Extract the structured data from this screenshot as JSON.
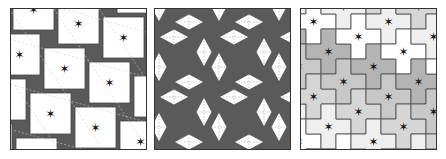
{
  "figure": {
    "panels": [
      {
        "id": "a",
        "description": "Pinwheel tiling of white squares with dark gray square gaps, each white square marked with a star, dashed lattice lines overlaid"
      },
      {
        "id": "b",
        "description": "Tiling of white rhombi (diamonds) on dark gray background with dotted diagonal lattice lines"
      },
      {
        "id": "c",
        "description": "Cross-shaped polyomino tiling in shades of gray, each tile marked with a star"
      }
    ],
    "colors": {
      "dark": "#5a5a5a",
      "white": "#ffffff",
      "light_gray": "#d6d6d6",
      "mid_gray": "#b4b4b4",
      "star": "#1a1a1a",
      "outline": "#333333"
    },
    "star_glyph": "✶"
  }
}
